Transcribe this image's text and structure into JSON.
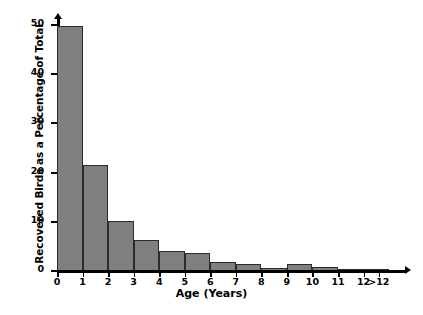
{
  "chart_data": {
    "type": "bar",
    "title": "",
    "xlabel": "Age (Years)",
    "ylabel": "Recovered Birds as a Percentage of Total",
    "categories": [
      "0-1",
      "1-2",
      "2-3",
      "3-4",
      "4-5",
      "5-6",
      "6-7",
      "7-8",
      "8-9",
      "9-10",
      "10-11",
      "11-12",
      ">12"
    ],
    "values": [
      49.5,
      21.4,
      9.9,
      6.0,
      3.8,
      3.4,
      1.7,
      1.3,
      0.5,
      1.2,
      0.6,
      0.3,
      0.3
    ],
    "bar_edges": [
      0,
      1,
      2,
      3,
      4,
      5,
      6,
      7,
      8,
      9,
      10,
      11,
      12,
      13
    ],
    "x_tick_labels": [
      "0",
      "1",
      "2",
      "3",
      "4",
      "5",
      "6",
      "7",
      "8",
      "9",
      "10",
      "11",
      "12",
      ">12"
    ],
    "x_tick_positions": [
      0,
      1,
      2,
      3,
      4,
      5,
      6,
      7,
      8,
      9,
      10,
      11,
      12,
      12.6
    ],
    "y_tick_labels": [
      "0",
      "10",
      "20",
      "30",
      "40",
      "50"
    ],
    "y_tick_values": [
      0,
      10,
      20,
      30,
      40,
      50
    ],
    "ylim": [
      0,
      51.2
    ],
    "xlim": [
      0,
      13.7
    ],
    "grid": false,
    "legend": false,
    "bar_fill_color": "#7f7f7f",
    "bar_edge_color": "#2b2b2b",
    "axis_color": "#000000",
    "background_color": "#ffffff"
  }
}
